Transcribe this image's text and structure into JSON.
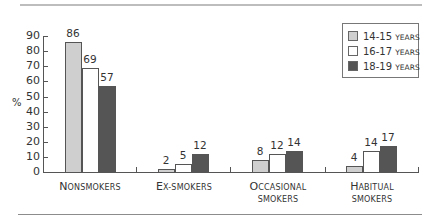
{
  "chart_data": {
    "type": "bar",
    "title": "",
    "xlabel": "",
    "ylabel": "%",
    "ylim": [
      0,
      90
    ],
    "yticks": [
      0,
      10,
      20,
      30,
      40,
      50,
      60,
      70,
      80,
      90
    ],
    "categories": [
      "Nonsmokers",
      "Ex-smokers",
      "Occasional smokers",
      "Habitual smokers"
    ],
    "series": [
      {
        "name": "14-15 years",
        "color": "#cfcfcf",
        "values": [
          86,
          2,
          8,
          4
        ]
      },
      {
        "name": "16-17 years",
        "color": "#ffffff",
        "values": [
          69,
          5,
          12,
          14
        ]
      },
      {
        "name": "18-19 years",
        "color": "#555555",
        "values": [
          57,
          12,
          14,
          17
        ]
      }
    ],
    "legend_position": "top-right",
    "grid": false,
    "data_labels": true
  },
  "axis": {
    "y_title": "%",
    "y_labels": [
      "0",
      "10",
      "20",
      "30",
      "40",
      "50",
      "60",
      "70",
      "80",
      "90"
    ]
  },
  "categories_display": [
    {
      "first": "N",
      "rest": "onsmokers",
      "line2": ""
    },
    {
      "first": "E",
      "rest": "x-smokers",
      "line2": ""
    },
    {
      "first": "O",
      "rest": "ccasional",
      "line2": "smokers"
    },
    {
      "first": "H",
      "rest": "abitual",
      "line2": "smokers"
    }
  ],
  "legend": [
    {
      "range": "14-15",
      "unit": "years"
    },
    {
      "range": "16-17",
      "unit": "years"
    },
    {
      "range": "18-19",
      "unit": "years"
    }
  ]
}
